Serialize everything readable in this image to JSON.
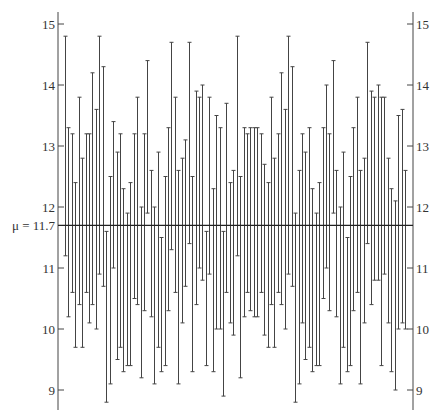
{
  "chart_data": {
    "type": "interval",
    "title": "",
    "xlabel": "",
    "ylabel": "",
    "ylim": [
      8.8,
      15.2
    ],
    "yticks": [
      9,
      10,
      11,
      12,
      13,
      14,
      15
    ],
    "tick_labels_left": [
      "9",
      "10",
      "11",
      "12",
      "13",
      "14",
      "15"
    ],
    "tick_labels_right": [
      "9",
      "10",
      "11",
      "12",
      "13",
      "14",
      "15"
    ],
    "reference_line": {
      "label": "μ = 11.7",
      "value": 11.7
    },
    "grid": false,
    "series": [
      {
        "name": "intervals",
        "lower": [
          11.2,
          10.2,
          10.6,
          9.7,
          10.4,
          9.7,
          10.6,
          10.1,
          10.4,
          10.0,
          10.9,
          10.7,
          8.8,
          9.1,
          11.0,
          9.5,
          9.7,
          9.3,
          9.4,
          9.4,
          10.5,
          10.4,
          9.2,
          10.3,
          11.9,
          10.2,
          9.1,
          9.7,
          9.3,
          9.4,
          10.3,
          11.3,
          10.6,
          9.1,
          10.1,
          10.7,
          11.4,
          9.3,
          10.4,
          11.0,
          10.8,
          9.4,
          10.9,
          9.3,
          10.0,
          10.0,
          8.9,
          10.6,
          10.1,
          9.9,
          11.2,
          9.2,
          10.2,
          10.6,
          10.3,
          10.2,
          10.2,
          10.6,
          9.9,
          9.7,
          10.4,
          9.7,
          10.6,
          10.4,
          10.0,
          10.9,
          10.7,
          8.8,
          9.1,
          10.1,
          9.5,
          9.7,
          9.3,
          9.4,
          9.4,
          10.5,
          11.0,
          10.3,
          11.9,
          10.2,
          9.1,
          9.7,
          9.3,
          9.4,
          10.3,
          10.6,
          9.1,
          10.1,
          11.4,
          10.4,
          10.8,
          10.8,
          9.4,
          10.9,
          10.1,
          9.3,
          9.0,
          10.0,
          10.1,
          10.0
        ],
        "upper": [
          14.8,
          13.3,
          13.2,
          12.4,
          13.8,
          12.8,
          13.2,
          13.2,
          14.2,
          13.6,
          14.8,
          14.3,
          11.6,
          12.5,
          13.4,
          12.9,
          13.2,
          12.3,
          11.9,
          12.4,
          13.2,
          13.8,
          12.0,
          13.2,
          14.4,
          12.6,
          12.0,
          12.9,
          11.5,
          12.5,
          13.3,
          14.7,
          13.8,
          12.6,
          12.8,
          13.1,
          14.7,
          12.5,
          13.9,
          13.8,
          14.0,
          11.6,
          13.8,
          12.3,
          13.5,
          13.3,
          11.6,
          13.7,
          12.4,
          12.6,
          14.8,
          12.5,
          13.3,
          13.2,
          13.3,
          13.3,
          13.3,
          13.2,
          12.7,
          12.4,
          13.8,
          12.8,
          13.2,
          14.2,
          13.6,
          14.8,
          14.3,
          11.9,
          12.6,
          13.2,
          12.9,
          13.3,
          12.3,
          11.9,
          12.4,
          13.3,
          14.0,
          13.2,
          14.4,
          12.6,
          12.0,
          12.9,
          11.5,
          12.5,
          13.3,
          13.8,
          12.6,
          12.8,
          14.7,
          13.9,
          13.8,
          14.0,
          13.8,
          13.8,
          12.8,
          12.3,
          12.1,
          13.5,
          13.6,
          12.6
        ]
      }
    ]
  },
  "axes": {
    "left": {
      "labels": [
        "9",
        "10",
        "11",
        "12",
        "13",
        "14",
        "15"
      ]
    },
    "right": {
      "labels": [
        "9",
        "10",
        "11",
        "12",
        "13",
        "14",
        "15"
      ]
    }
  },
  "reference": {
    "label": "μ = 11.7"
  },
  "colors": {
    "line": "#444444",
    "reference": "#222222",
    "text": "#333333"
  }
}
